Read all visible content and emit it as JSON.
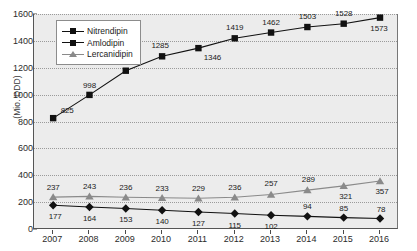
{
  "chart_data": {
    "type": "line",
    "title": "",
    "xlabel": "",
    "ylabel": "(Mio. DDD)",
    "categories": [
      "2007",
      "2008",
      "2009",
      "2010",
      "2011",
      "2012",
      "2013",
      "2014",
      "2015",
      "2016"
    ],
    "ylim": [
      0,
      1600
    ],
    "yticks": [
      0,
      200,
      400,
      600,
      800,
      1000,
      1200,
      1400,
      1600
    ],
    "grid": true,
    "legend_position": "top-left inside plot",
    "series": [
      {
        "name": "Nitrendipin",
        "marker": "diamond",
        "color": "#111111",
        "values": [
          177,
          164,
          153,
          140,
          127,
          115,
          102,
          94,
          85,
          78
        ]
      },
      {
        "name": "Amlodipin",
        "marker": "square",
        "color": "#111111",
        "values": [
          825,
          998,
          1178,
          1285,
          1346,
          1419,
          1462,
          1503,
          1528,
          1573
        ]
      },
      {
        "name": "Lercanidipin",
        "marker": "triangle",
        "color": "#8a8a8a",
        "values": [
          237,
          243,
          236,
          233,
          229,
          236,
          257,
          289,
          321,
          357
        ]
      }
    ]
  },
  "legend": {
    "items": [
      {
        "label": "Nitrendipin"
      },
      {
        "label": "Amlodipin"
      },
      {
        "label": "Lercanidipin"
      }
    ]
  },
  "axes": {
    "y_axis_title": "(Mio. DDD)",
    "y_tick_labels": [
      "1600",
      "1400",
      "1200",
      "1000",
      "800",
      "600",
      "400",
      "200",
      "0"
    ],
    "x_tick_labels": [
      "2007",
      "2008",
      "2009",
      "2010",
      "2011",
      "2012",
      "2013",
      "2014",
      "2015",
      "2016"
    ]
  },
  "colors": {
    "plot_background": "#ececec",
    "page_background": "#ffffff",
    "gridline": "#9a9a9a",
    "axis": "#555555",
    "series_dark": "#111111",
    "series_gray": "#8a8a8a"
  }
}
